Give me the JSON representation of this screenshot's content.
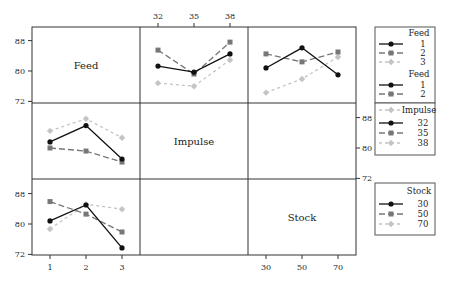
{
  "chart_data": {
    "type": "line",
    "factors": {
      "Feed": [
        "1",
        "2",
        "3"
      ],
      "Impulse": [
        "32",
        "35",
        "38"
      ],
      "Stock": [
        "30",
        "50",
        "70"
      ]
    },
    "diagonal_labels": [
      "Feed",
      "Impulse",
      "Stock"
    ],
    "yticks": [
      72,
      80,
      88
    ],
    "ylim": [
      72,
      90
    ],
    "panels": [
      {
        "id": "feed-by-impulse",
        "row": 0,
        "col": 1,
        "x_factor": "Impulse",
        "trace_factor": "Feed",
        "categories": [
          "32",
          "35",
          "38"
        ],
        "series": [
          {
            "name": "1",
            "values": [
              81.3,
              79.7,
              84.5
            ]
          },
          {
            "name": "2",
            "values": [
              85.5,
              79.2,
              87.6
            ]
          },
          {
            "name": "3",
            "values": [
              76.8,
              76.0,
              82.9
            ]
          }
        ]
      },
      {
        "id": "feed-by-stock",
        "row": 0,
        "col": 2,
        "x_factor": "Stock",
        "trace_factor": "Feed",
        "categories": [
          "30",
          "50",
          "70"
        ],
        "series": [
          {
            "name": "1",
            "values": [
              80.8,
              86.1,
              79.0
            ]
          },
          {
            "name": "2",
            "values": [
              84.5,
              82.4,
              85.0
            ]
          },
          {
            "name": "3",
            "values": [
              74.3,
              77.9,
              83.7
            ]
          }
        ]
      },
      {
        "id": "impulse-by-feed",
        "row": 1,
        "col": 0,
        "x_factor": "Feed",
        "trace_factor": "Impulse",
        "categories": [
          "1",
          "2",
          "3"
        ],
        "series": [
          {
            "name": "32",
            "values": [
              81.6,
              85.9,
              77.1
            ]
          },
          {
            "name": "35",
            "values": [
              80.0,
              79.2,
              76.3
            ]
          },
          {
            "name": "38",
            "values": [
              84.5,
              87.7,
              82.7
            ]
          }
        ]
      },
      {
        "id": "stock-by-feed",
        "row": 2,
        "col": 0,
        "x_factor": "Feed",
        "trace_factor": "Stock",
        "categories": [
          "1",
          "2",
          "3"
        ],
        "series": [
          {
            "name": "30",
            "values": [
              80.8,
              85.0,
              73.7
            ]
          },
          {
            "name": "50",
            "values": [
              85.9,
              82.6,
              77.9
            ]
          },
          {
            "name": "70",
            "values": [
              78.7,
              85.2,
              83.9
            ]
          }
        ]
      }
    ],
    "axes": {
      "top_ticks": [
        "32",
        "35",
        "38"
      ],
      "bottom_ticks_col1": [
        "1",
        "2",
        "3"
      ],
      "bottom_ticks_col3": [
        "30",
        "50",
        "70"
      ],
      "left_ticks_row1": [
        "88",
        "80",
        "72"
      ],
      "right_ticks_row2": [
        "88",
        "80",
        "72"
      ],
      "left_ticks_row3": [
        "88",
        "80",
        "72"
      ]
    },
    "legends": [
      {
        "title": "Feed",
        "entries": [
          "1",
          "2",
          "3"
        ]
      },
      {
        "title": "Feed",
        "entries": [
          "1",
          "2"
        ]
      },
      {
        "title": "Impulse",
        "entries": [
          "32",
          "35",
          "38"
        ]
      },
      {
        "title": "Stock",
        "entries": [
          "30",
          "50",
          "70"
        ]
      }
    ],
    "series_styles": [
      {
        "color": "#111111",
        "marker": "circle",
        "dash": "none"
      },
      {
        "color": "#777777",
        "marker": "square",
        "dash": "6,3"
      },
      {
        "color": "#c4c4c4",
        "marker": "diamond",
        "dash": "3,3"
      }
    ],
    "grid": false,
    "legend_position": "right"
  }
}
